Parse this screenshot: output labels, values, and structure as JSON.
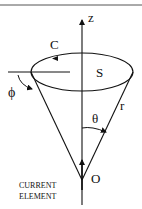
{
  "diagram": {
    "labels": {
      "z_axis": "z",
      "contour": "C",
      "surface": "S",
      "azimuth": "ϕ",
      "polar_angle": "θ",
      "radius": "r",
      "origin": "O",
      "current_element_line1": "CURRENT",
      "current_element_line2": "ELEMENT"
    },
    "colors": {
      "stroke": "#111111",
      "background": "#ffffff"
    }
  }
}
